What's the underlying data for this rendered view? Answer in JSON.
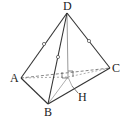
{
  "figure": {
    "type": "tetrahedron",
    "labels": {
      "D": "D",
      "A": "A",
      "B": "B",
      "C": "C",
      "H": "H"
    },
    "points": {
      "D": [
        67,
        13
      ],
      "A": [
        21,
        78
      ],
      "B": [
        48,
        104
      ],
      "C": [
        110,
        68
      ],
      "O": [
        68,
        77
      ],
      "H": [
        66,
        84
      ]
    },
    "edges": {
      "solid": [
        "DA",
        "DB",
        "DC",
        "AB",
        "BC"
      ],
      "dashed": [
        "AC",
        "AO",
        "OC"
      ],
      "gray": [
        "DO",
        "OH",
        "OB"
      ]
    },
    "equal_marks": [
      "DA",
      "DB",
      "DC"
    ],
    "right_angle_marks": 2,
    "colors": {
      "line": "#333333",
      "auxiliary": "#999999"
    }
  }
}
